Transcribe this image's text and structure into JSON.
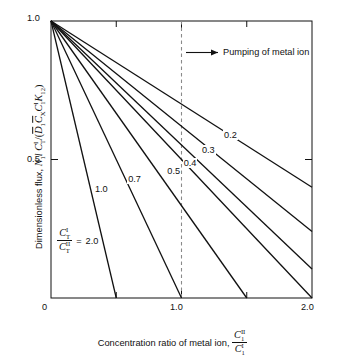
{
  "figure": {
    "background_color": "#ffffff",
    "line_color": "#111111",
    "reference_line_color": "#8a8a8a"
  },
  "axes": {
    "x": {
      "title_text": "Concentration ratio of metal ion, ",
      "title_symbol_num": "C",
      "title_symbol_num_sup": "II",
      "title_symbol_num_sub": "1",
      "title_symbol_den": "C",
      "title_symbol_den_sup": "I",
      "title_symbol_den_sub": "1",
      "ticks": [
        "0",
        "1.0",
        "2.0"
      ],
      "tick_values": [
        0,
        1.0,
        2.0
      ],
      "range": [
        0,
        2.0
      ],
      "minor_ticks": [
        0.5,
        1.5
      ]
    },
    "y": {
      "title_prefix": "Dimensionless flux, ",
      "title_sym_N": "N",
      "title_sym_N_sub": "1",
      "title_sym_l": "l",
      "title_sym_C": "C",
      "title_sym_C_sup": "I",
      "title_sym_C_sub": "T",
      "title_slash": "/",
      "title_open": "(",
      "title_D": "D",
      "title_D_sub": "1",
      "title_Cx": "C",
      "title_Cx_sub": "X",
      "title_C1": "C",
      "title_C1_sup": "I",
      "title_C1_sub": "1",
      "title_K": "K",
      "title_K_sub": "12",
      "title_close": ")",
      "ticks": [
        "0.5",
        "1.0"
      ],
      "tick_values": [
        0.5,
        1.0
      ],
      "range": [
        0,
        1.0
      ]
    }
  },
  "annotations": {
    "pumping": {
      "text": "Pumping of metal ion",
      "arrow": "right-arrow"
    },
    "legend": {
      "num_symbol": "C",
      "num_sup": "I",
      "num_sub": "T",
      "den_symbol": "C",
      "den_sup": "II",
      "den_sub": "T",
      "equals": "=",
      "value": "2.0"
    },
    "reference_line": {
      "x": 1.0,
      "style": "dashed"
    }
  },
  "chart_data": {
    "type": "line",
    "title": "",
    "xlabel": "Concentration ratio of metal ion, C1_II / C1_I",
    "ylabel": "Dimensionless flux, N1 l C_T^I / (D1bar C_Xbar C_1^I K12)",
    "xlim": [
      0,
      2.0
    ],
    "ylim": [
      0,
      1.0
    ],
    "grid": false,
    "legend_position": "inline-curve-labels",
    "legend_title": "C_T^I / C_T^II",
    "series": [
      {
        "name": "0.2",
        "label": "0.2",
        "x": [
          0,
          2.0
        ],
        "y": [
          1.0,
          0.4
        ],
        "label_at_x": 1.38,
        "label_at_y": 0.585
      },
      {
        "name": "0.3",
        "label": "0.3",
        "x": [
          0,
          2.0
        ],
        "y": [
          1.0,
          0.24
        ],
        "label_at_x": 1.21,
        "label_at_y": 0.53
      },
      {
        "name": "0.4",
        "label": "0.4",
        "x": [
          0,
          2.0
        ],
        "y": [
          1.0,
          0.105
        ],
        "label_at_x": 1.07,
        "label_at_y": 0.485
      },
      {
        "name": "0.5",
        "label": "0.5",
        "x": [
          0,
          2.0
        ],
        "y": [
          1.0,
          0.0
        ],
        "label_at_x": 0.945,
        "label_at_y": 0.455
      },
      {
        "name": "0.7",
        "label": "0.7",
        "x": [
          0,
          1.5
        ],
        "y": [
          1.0,
          0.0
        ],
        "label_at_x": 0.645,
        "label_at_y": 0.425
      },
      {
        "name": "1.0",
        "label": "1.0",
        "x": [
          0,
          1.0
        ],
        "y": [
          1.0,
          0.0
        ],
        "label_at_x": 0.39,
        "label_at_y": 0.39
      },
      {
        "name": "2.0",
        "label": "2.0",
        "x": [
          0,
          0.5
        ],
        "y": [
          1.0,
          0.0
        ],
        "label_at_x": 0.215,
        "label_at_y": 0.255
      }
    ]
  }
}
